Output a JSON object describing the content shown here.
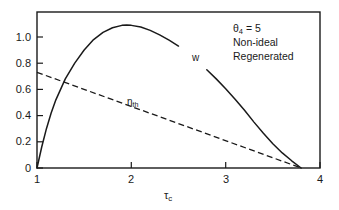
{
  "chart_data": {
    "type": "line",
    "title": "",
    "xlabel": "τc",
    "ylabel": "",
    "xlim": [
      1,
      4
    ],
    "ylim": [
      0,
      1.19
    ],
    "grid": false,
    "legend_position": "inline-labels",
    "xticks": [
      "1",
      "2",
      "3",
      "4"
    ],
    "xtick_values": [
      1,
      2,
      3,
      4
    ],
    "yticks": [
      "0",
      "0.2",
      "0.4",
      "0.6",
      "0.8",
      "1.0"
    ],
    "ytick_values": [
      0,
      0.2,
      0.4,
      0.6,
      0.8,
      1.0
    ],
    "series": [
      {
        "name": "w",
        "label": "w",
        "style": "solid",
        "color": "#1a1a1a",
        "x": [
          1.0,
          1.05,
          1.1,
          1.15,
          1.2,
          1.3,
          1.4,
          1.5,
          1.6,
          1.7,
          1.8,
          1.9,
          1.95,
          2.0,
          2.1,
          2.2,
          2.3,
          2.4,
          2.5,
          2.6,
          2.7,
          2.8,
          2.9,
          3.0,
          3.1,
          3.2,
          3.3,
          3.4,
          3.5,
          3.6,
          3.7,
          3.8
        ],
        "values": [
          0.0,
          0.16,
          0.3,
          0.42,
          0.52,
          0.68,
          0.8,
          0.9,
          0.98,
          1.035,
          1.07,
          1.088,
          1.09,
          1.088,
          1.075,
          1.05,
          1.015,
          0.975,
          0.93,
          0.875,
          0.815,
          0.75,
          0.68,
          0.605,
          0.525,
          0.44,
          0.35,
          0.265,
          0.185,
          0.115,
          0.055,
          0.0
        ]
      },
      {
        "name": "eta_th",
        "label": "ηth",
        "style": "dashed",
        "color": "#1a1a1a",
        "x": [
          1.0,
          3.8
        ],
        "values": [
          0.73,
          0.0
        ]
      }
    ],
    "annotations": [
      "θ4 = 5",
      "Non-ideal",
      "Regenerated"
    ]
  },
  "axes": {
    "x_title": "τ",
    "x_title_sub": "c",
    "xticks": [
      {
        "label": "1",
        "value": 1
      },
      {
        "label": "2",
        "value": 2
      },
      {
        "label": "3",
        "value": 3
      },
      {
        "label": "4",
        "value": 4
      }
    ],
    "yticks": [
      {
        "label": "1.0",
        "value": 1.0
      },
      {
        "label": "0.8",
        "value": 0.8
      },
      {
        "label": "0.6",
        "value": 0.6
      },
      {
        "label": "0.4",
        "value": 0.4
      },
      {
        "label": "0.2",
        "value": 0.2
      },
      {
        "label": "0",
        "value": 0
      }
    ]
  },
  "labels": {
    "w_label": "w",
    "eta_symbol": "η",
    "eta_sub": "th"
  },
  "annotation": {
    "theta_symbol": "θ",
    "theta_sub": "4",
    "theta_eq": "= 5",
    "line2": "Non-ideal",
    "line3": "Regenerated"
  },
  "colors": {
    "ink": "#1a1a1a",
    "background": "#ffffff"
  }
}
